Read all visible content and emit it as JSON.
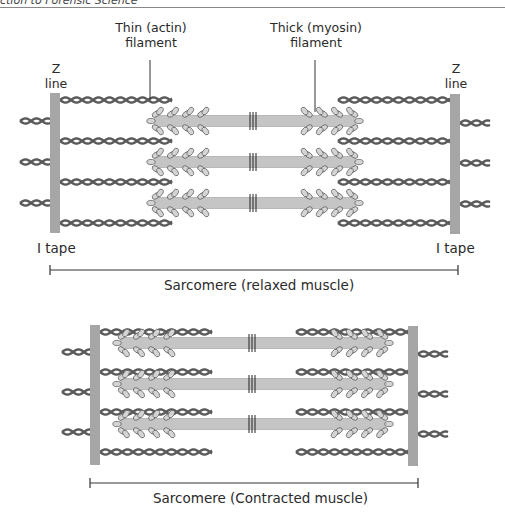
{
  "header": {
    "text": "ction to Forensic Science"
  },
  "labels": {
    "thin_filament_line1": "Thin (actin)",
    "thin_filament_line2": "filament",
    "thick_filament_line1": "Thick (myosin)",
    "thick_filament_line2": "filament",
    "z_line_left_1": "Z",
    "z_line_left_2": "line",
    "z_line_right_1": "Z",
    "z_line_right_2": "line",
    "i_band_left": "I tape",
    "i_band_right": "I tape",
    "relaxed_caption": "Sarcomere (relaxed muscle)",
    "contracted_caption": "Sarcomere (Contracted muscle)"
  },
  "colors": {
    "z_line": "#a6a6a6",
    "actin": "#5a5a5a",
    "myosin_shaft": "#b8b8b8",
    "myosin_head": "#d4d4d4",
    "myosin_outline": "#555555",
    "m_line": "#222222",
    "scale_bar": "#333333"
  },
  "relaxed": {
    "z_left": {
      "x": 50,
      "y": 93,
      "w": 10,
      "h": 140
    },
    "z_right": {
      "x": 450,
      "y": 94,
      "w": 10,
      "h": 140
    },
    "actin_inner_rows": [
      100,
      141,
      182,
      223
    ],
    "actin_inner_left": [
      60,
      172
    ],
    "actin_inner_right": [
      338,
      450
    ],
    "actin_outer_rows_left": [
      121,
      162,
      203
    ],
    "actin_outer_rows_right": [
      123,
      163,
      204
    ],
    "actin_outer_left": [
      20,
      50
    ],
    "actin_outer_right": [
      460,
      490
    ],
    "myosin_rows": [
      121,
      162,
      203
    ],
    "myosin_x": [
      148,
      362
    ],
    "m_line_x": 253,
    "scale_bar": {
      "x1": 50,
      "x2": 458,
      "y": 270
    }
  },
  "contracted": {
    "z_left": {
      "x": 90,
      "y": 325,
      "w": 10,
      "h": 140
    },
    "z_right": {
      "x": 408,
      "y": 326,
      "w": 10,
      "h": 140
    },
    "actin_inner_rows": [
      332,
      372,
      412,
      452
    ],
    "actin_inner_left": [
      100,
      212
    ],
    "actin_inner_right": [
      296,
      408
    ],
    "actin_outer_rows_left": [
      352,
      392,
      432
    ],
    "actin_outer_rows_right": [
      354,
      394,
      434
    ],
    "actin_outer_left": [
      62,
      90
    ],
    "actin_outer_right": [
      418,
      448
    ],
    "myosin_rows": [
      343,
      384,
      424
    ],
    "myosin_x": [
      114,
      392
    ],
    "m_line_x": 252,
    "scale_bar": {
      "x1": 90,
      "x2": 418,
      "y": 483
    }
  }
}
